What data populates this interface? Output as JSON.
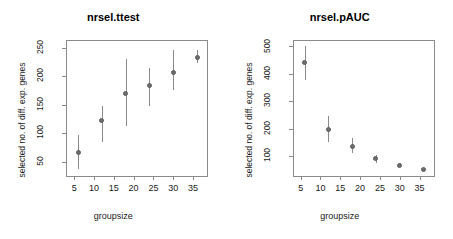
{
  "chart_data": [
    {
      "type": "scatter",
      "title": "nrsel.ttest",
      "xlabel": "groupsize",
      "ylabel": "selected no. of diff. exp. genes",
      "x": [
        6,
        12,
        18,
        24,
        30,
        36
      ],
      "values": [
        67,
        122,
        170,
        184,
        207,
        233
      ],
      "err_low": [
        37,
        84,
        112,
        148,
        176,
        223
      ],
      "err_high": [
        97,
        148,
        231,
        214,
        246,
        246
      ],
      "xticks": [
        5,
        10,
        15,
        20,
        25,
        30,
        35
      ],
      "yticks": [
        50,
        100,
        150,
        200,
        250
      ],
      "xlim": [
        3.2,
        38.5
      ],
      "ylim": [
        25,
        262
      ],
      "grid": false,
      "legend": "none"
    },
    {
      "type": "scatter",
      "title": "nrsel.pAUC",
      "xlabel": "groupsize",
      "ylabel": "selected no. of diff. exp. genes",
      "x": [
        6,
        12,
        18,
        24,
        30,
        36
      ],
      "values": [
        440,
        198,
        137,
        90,
        68,
        50
      ],
      "err_low": [
        378,
        152,
        113,
        77,
        62,
        45
      ],
      "err_high": [
        500,
        245,
        165,
        104,
        76,
        56
      ],
      "xticks": [
        5,
        10,
        15,
        20,
        25,
        30,
        35
      ],
      "yticks": [
        100,
        200,
        300,
        400,
        500
      ],
      "xlim": [
        3.2,
        38.5
      ],
      "ylim": [
        28,
        520
      ],
      "grid": false,
      "legend": "none"
    }
  ],
  "panels": [
    {
      "title": "nrsel.ttest",
      "xlabel": "groupsize",
      "ylabel": "selected no. of diff. exp. genes",
      "yticks": [
        "50",
        "100",
        "150",
        "200",
        "250"
      ],
      "xticks": [
        "5",
        "10",
        "15",
        "20",
        "25",
        "30",
        "35"
      ]
    },
    {
      "title": "nrsel.pAUC",
      "xlabel": "groupsize",
      "ylabel": "selected no. of diff. exp. genes",
      "yticks": [
        "100",
        "200",
        "300",
        "400",
        "500"
      ],
      "xticks": [
        "5",
        "10",
        "15",
        "20",
        "25",
        "30",
        "35"
      ]
    }
  ],
  "colors": {
    "point": "#6e6e6e",
    "axis": "#8a8a8a",
    "text": "#1a1a1a",
    "background": "#ffffff"
  }
}
